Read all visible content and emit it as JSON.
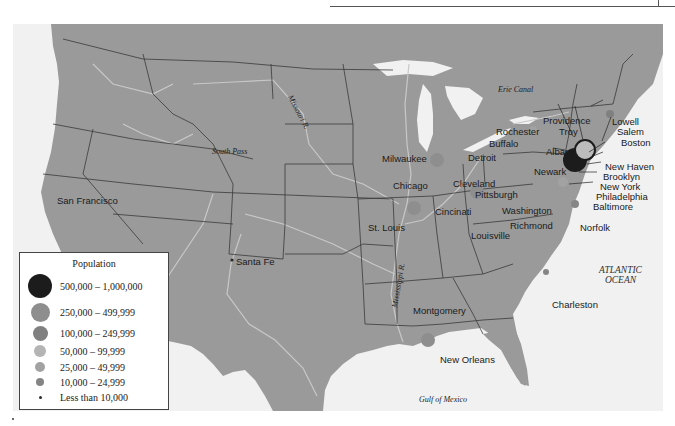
{
  "map": {
    "land_color": "#9a9a9a",
    "water_color": "#f1f1f1",
    "border_color": "#3a3a3a",
    "river_color": "#c8c8c8",
    "features": {
      "missouri_river": "Missouri R.",
      "mississippi_river": "Mississippi R.",
      "south_pass": "South Pass",
      "erie_canal": "Erie Canal",
      "atlantic_ocean_line1": "ATLANTIC",
      "atlantic_ocean_line2": "OCEAN",
      "gulf_of_mexico": "Gulf of Mexico"
    },
    "cities": [
      {
        "name": "San Francisco",
        "x": 44,
        "y": 172,
        "size_class": null
      },
      {
        "name": "Santa Fe",
        "x": 223,
        "y": 233,
        "size_class": "lt10k"
      },
      {
        "name": "Milwaukee",
        "x": 382,
        "y": 131,
        "size_class": null
      },
      {
        "name": "Detroit",
        "x": 454,
        "y": 130,
        "size_class": null
      },
      {
        "name": "Chicago",
        "x": 394,
        "y": 158,
        "size_class": null
      },
      {
        "name": "Cleveland",
        "x": 455,
        "y": 155,
        "size_class": null
      },
      {
        "name": "Pittsburgh",
        "x": 475,
        "y": 166,
        "size_class": null
      },
      {
        "name": "Cincinati",
        "x": 432,
        "y": 184,
        "size_class": null
      },
      {
        "name": "St. Louis",
        "x": 369,
        "y": 199,
        "size_class": null
      },
      {
        "name": "Louisville",
        "x": 445,
        "y": 207,
        "size_class": null
      },
      {
        "name": "Washington",
        "x": 502,
        "y": 183,
        "size_class": null
      },
      {
        "name": "Richmond",
        "x": 509,
        "y": 198,
        "size_class": null
      },
      {
        "name": "Norfolk",
        "x": 580,
        "y": 200,
        "size_class": null
      },
      {
        "name": "Rochester",
        "x": 495,
        "y": 103,
        "size_class": null
      },
      {
        "name": "Buffalo",
        "x": 489,
        "y": 116,
        "size_class": null
      },
      {
        "name": "Albany",
        "x": 545,
        "y": 124,
        "size_class": null
      },
      {
        "name": "Providence",
        "x": 544,
        "y": 93,
        "size_class": null
      },
      {
        "name": "Troy",
        "x": 559,
        "y": 103,
        "size_class": null
      },
      {
        "name": "Lowell",
        "x": 612,
        "y": 93,
        "size_class": null
      },
      {
        "name": "Salem",
        "x": 617,
        "y": 103,
        "size_class": null
      },
      {
        "name": "Boston",
        "x": 621,
        "y": 114,
        "size_class": null
      },
      {
        "name": "Newark",
        "x": 534,
        "y": 144,
        "size_class": null
      },
      {
        "name": "New Haven",
        "x": 605,
        "y": 140,
        "size_class": null
      },
      {
        "name": "Brooklyn",
        "x": 603,
        "y": 150,
        "size_class": null
      },
      {
        "name": "New York",
        "x": 600,
        "y": 160,
        "size_class": null
      },
      {
        "name": "Philadelphia",
        "x": 596,
        "y": 170,
        "size_class": null
      },
      {
        "name": "Baltimore",
        "x": 593,
        "y": 180,
        "size_class": null
      },
      {
        "name": "Montgomery",
        "x": 413,
        "y": 283,
        "size_class": null
      },
      {
        "name": "New Orleans",
        "x": 439,
        "y": 332,
        "size_class": null
      },
      {
        "name": "Charleston",
        "x": 552,
        "y": 277,
        "size_class": null
      }
    ]
  },
  "legend": {
    "title": "Population",
    "items": [
      {
        "label": "500,000 – 1,000,000",
        "color": "#1c1c1c",
        "size": 24
      },
      {
        "label": "250,000 – 499,999",
        "color": "#8e8e8e",
        "size": 19
      },
      {
        "label": "100,000 – 249,999",
        "color": "#808080",
        "size": 15
      },
      {
        "label": "50,000 – 99,999",
        "color": "#b4b4b4",
        "size": 12
      },
      {
        "label": "25,000 – 49,999",
        "color": "#a2a2a2",
        "size": 10
      },
      {
        "label": "10,000 – 24,999",
        "color": "#858585",
        "size": 8
      },
      {
        "label": "Less than 10,000",
        "color": "#2a2a2a",
        "size": 3
      }
    ]
  }
}
